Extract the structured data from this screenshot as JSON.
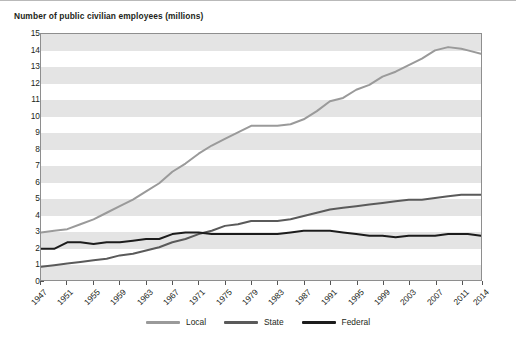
{
  "chart_data": {
    "type": "line",
    "title": "Number of public civilian employees (millions)",
    "xlabel": "",
    "ylabel": "",
    "ylim": [
      0,
      15
    ],
    "ytick_step": 1,
    "yticks": [
      0,
      1,
      2,
      3,
      4,
      5,
      6,
      7,
      8,
      9,
      10,
      11,
      12,
      13,
      14,
      15
    ],
    "xlim": [
      1947,
      2014
    ],
    "xticks": [
      1947,
      1951,
      1955,
      1959,
      1963,
      1967,
      1971,
      1975,
      1979,
      1983,
      1987,
      1991,
      1995,
      1999,
      2003,
      2007,
      2011,
      2014
    ],
    "grid": false,
    "banded_background": true,
    "legend_position": "bottom-center",
    "x": [
      1947,
      1949,
      1951,
      1953,
      1955,
      1957,
      1959,
      1961,
      1963,
      1965,
      1967,
      1969,
      1971,
      1973,
      1975,
      1977,
      1979,
      1981,
      1983,
      1985,
      1987,
      1989,
      1991,
      1993,
      1995,
      1997,
      1999,
      2001,
      2003,
      2005,
      2007,
      2009,
      2011,
      2012,
      2014
    ],
    "series": [
      {
        "name": "Local",
        "color": "#9a9a9a",
        "values": [
          2.9,
          3.0,
          3.1,
          3.4,
          3.7,
          4.1,
          4.5,
          4.9,
          5.4,
          5.9,
          6.6,
          7.1,
          7.7,
          8.2,
          8.6,
          9.0,
          9.4,
          9.4,
          9.4,
          9.5,
          9.8,
          10.3,
          10.9,
          11.1,
          11.6,
          11.9,
          12.4,
          12.7,
          13.1,
          13.5,
          14.0,
          14.2,
          14.1,
          14.0,
          13.8
        ]
      },
      {
        "name": "State",
        "color": "#5a5a5a",
        "values": [
          0.8,
          0.9,
          1.0,
          1.1,
          1.2,
          1.3,
          1.5,
          1.6,
          1.8,
          2.0,
          2.3,
          2.5,
          2.8,
          3.0,
          3.3,
          3.4,
          3.6,
          3.6,
          3.6,
          3.7,
          3.9,
          4.1,
          4.3,
          4.4,
          4.5,
          4.6,
          4.7,
          4.8,
          4.9,
          4.9,
          5.0,
          5.1,
          5.2,
          5.2,
          5.2
        ]
      },
      {
        "name": "Federal",
        "color": "#1c1c1c",
        "values": [
          1.9,
          1.9,
          2.3,
          2.3,
          2.2,
          2.3,
          2.3,
          2.4,
          2.5,
          2.5,
          2.8,
          2.9,
          2.9,
          2.8,
          2.8,
          2.8,
          2.8,
          2.8,
          2.8,
          2.9,
          3.0,
          3.0,
          3.0,
          2.9,
          2.8,
          2.7,
          2.7,
          2.6,
          2.7,
          2.7,
          2.7,
          2.8,
          2.8,
          2.8,
          2.7
        ]
      }
    ]
  },
  "legend": {
    "items": [
      {
        "label": "Local"
      },
      {
        "label": "State"
      },
      {
        "label": "Federal"
      }
    ]
  }
}
